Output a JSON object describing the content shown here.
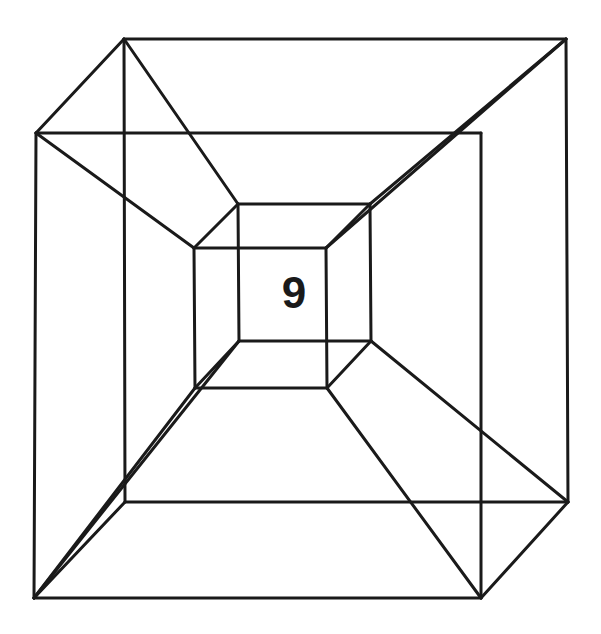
{
  "diagram": {
    "label": "9",
    "stroke_color": "#1a1a1a",
    "background": "#ffffff",
    "vertices": {
      "outer_back_tl": [
        124,
        39
      ],
      "outer_back_tr": [
        566,
        39
      ],
      "outer_back_br": [
        568,
        502
      ],
      "outer_back_bl": [
        125,
        502
      ],
      "outer_front_tl": [
        36,
        133
      ],
      "outer_front_tr": [
        481,
        133
      ],
      "outer_front_br": [
        481,
        598
      ],
      "outer_front_bl": [
        34,
        598
      ],
      "inner_back_tl": [
        238,
        204
      ],
      "inner_back_tr": [
        370,
        204
      ],
      "inner_back_br": [
        371,
        341
      ],
      "inner_back_bl": [
        239,
        341
      ],
      "inner_front_tl": [
        194,
        248
      ],
      "inner_front_tr": [
        326,
        248
      ],
      "inner_front_br": [
        327,
        388
      ],
      "inner_front_bl": [
        195,
        388
      ]
    },
    "edges": [
      [
        "outer_back_tl",
        "outer_back_tr"
      ],
      [
        "outer_back_tr",
        "outer_back_br"
      ],
      [
        "outer_back_br",
        "outer_back_bl"
      ],
      [
        "outer_back_bl",
        "outer_back_tl"
      ],
      [
        "outer_front_tl",
        "outer_front_tr"
      ],
      [
        "outer_front_tr",
        "outer_front_br"
      ],
      [
        "outer_front_br",
        "outer_front_bl"
      ],
      [
        "outer_front_bl",
        "outer_front_tl"
      ],
      [
        "inner_back_tl",
        "inner_back_tr"
      ],
      [
        "inner_back_tr",
        "inner_back_br"
      ],
      [
        "inner_back_br",
        "inner_back_bl"
      ],
      [
        "inner_back_bl",
        "inner_back_tl"
      ],
      [
        "inner_front_tl",
        "inner_front_tr"
      ],
      [
        "inner_front_tr",
        "inner_front_br"
      ],
      [
        "inner_front_br",
        "inner_front_bl"
      ],
      [
        "inner_front_bl",
        "inner_front_tl"
      ],
      [
        "outer_front_tl",
        "outer_back_tl"
      ],
      [
        "outer_back_tl",
        "inner_back_tl"
      ],
      [
        "outer_front_tl",
        "inner_front_tl"
      ],
      [
        "inner_front_tl",
        "inner_back_tl"
      ],
      [
        "outer_back_tr",
        "inner_back_tr"
      ],
      [
        "outer_back_tr",
        "inner_front_tr"
      ],
      [
        "inner_front_tr",
        "inner_back_tr"
      ],
      [
        "outer_front_bl",
        "outer_back_bl"
      ],
      [
        "outer_front_bl",
        "inner_back_bl"
      ],
      [
        "outer_front_bl",
        "inner_front_bl"
      ],
      [
        "inner_front_bl",
        "inner_back_bl"
      ],
      [
        "outer_back_br",
        "inner_back_br"
      ],
      [
        "outer_front_br",
        "inner_front_br"
      ],
      [
        "outer_front_br",
        "outer_back_br"
      ],
      [
        "inner_front_br",
        "inner_back_br"
      ]
    ]
  }
}
